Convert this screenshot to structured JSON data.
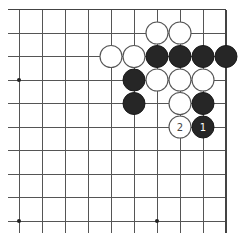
{
  "board": {
    "visible_columns": 10,
    "visible_rows": 10,
    "edges": {
      "top": "board-edge",
      "right": "board-edge",
      "bottom": "open",
      "left": "open"
    },
    "star_points": [
      {
        "col": 0,
        "row": 3
      },
      {
        "col": 0,
        "row": 9
      },
      {
        "col": 6,
        "row": 9
      }
    ],
    "stones": [
      {
        "color": "white",
        "col": 6,
        "row": 1
      },
      {
        "color": "white",
        "col": 7,
        "row": 1
      },
      {
        "color": "white",
        "col": 4,
        "row": 2
      },
      {
        "color": "white",
        "col": 5,
        "row": 2
      },
      {
        "color": "black",
        "col": 6,
        "row": 2
      },
      {
        "color": "black",
        "col": 7,
        "row": 2
      },
      {
        "color": "black",
        "col": 8,
        "row": 2
      },
      {
        "color": "black",
        "col": 9,
        "row": 2
      },
      {
        "color": "black",
        "col": 5,
        "row": 3
      },
      {
        "color": "white",
        "col": 6,
        "row": 3
      },
      {
        "color": "white",
        "col": 7,
        "row": 3
      },
      {
        "color": "white",
        "col": 8,
        "row": 3
      },
      {
        "color": "black",
        "col": 5,
        "row": 4
      },
      {
        "color": "white",
        "col": 7,
        "row": 4
      },
      {
        "color": "black",
        "col": 8,
        "row": 4
      },
      {
        "color": "white",
        "col": 7,
        "row": 5,
        "label": "2"
      },
      {
        "color": "black",
        "col": 8,
        "row": 5,
        "label": "1"
      }
    ]
  },
  "colors": {
    "black_stone": "#262626",
    "white_stone": "#ffffff",
    "grid": "#555555",
    "background": "#ffffff"
  }
}
